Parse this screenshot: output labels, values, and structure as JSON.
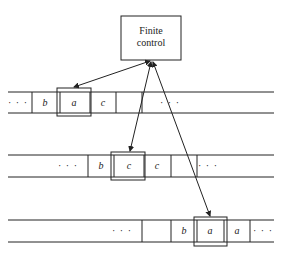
{
  "finite_control": {
    "line1": "Finite",
    "line2": "control"
  },
  "tapes": [
    {
      "cells": [
        "· · ·",
        "b",
        "a",
        "c",
        "",
        "· · ·"
      ],
      "head_index": 2
    },
    {
      "cells": [
        "· · ·",
        "b",
        "c",
        "c",
        "",
        "· · ·"
      ],
      "head_index": 2
    },
    {
      "cells": [
        "· · ·",
        "",
        "b",
        "a",
        "a",
        "· · ·"
      ],
      "head_index": 3
    }
  ],
  "t1": {
    "c0": "· · ·",
    "c1": "b",
    "c2": "a",
    "c3": "c",
    "c5": "· · ·"
  },
  "t2": {
    "c0": "· · ·",
    "c1": "b",
    "c2": "c",
    "c3": "c",
    "c5": "· · ·"
  },
  "t3": {
    "c0": "· · ·",
    "c2": "b",
    "c3": "a",
    "c4": "a",
    "c5": "· · ·"
  }
}
